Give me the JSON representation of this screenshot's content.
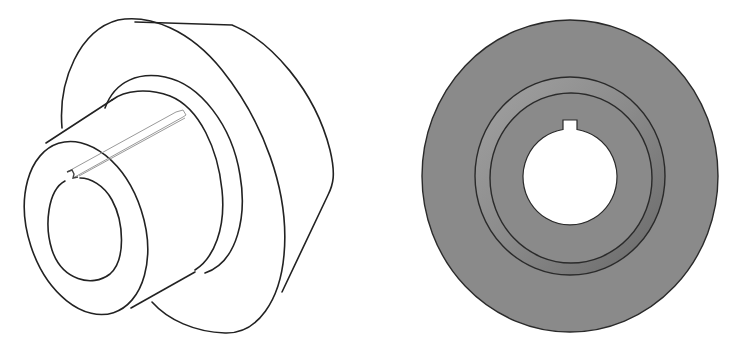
{
  "figure": {
    "type": "mechanical-part-drawing",
    "part": "keyed flanged hub / pulley",
    "views": [
      {
        "id": "isometric",
        "label": "Isometric line view",
        "style": "line-art",
        "stroke_color": "#222222",
        "keyway_stroke_color": "#9a9a9a",
        "fill_color": "#ffffff"
      },
      {
        "id": "front",
        "label": "Front shaded view",
        "style": "shaded",
        "face_color": "#8a8a8a",
        "ring_shadow_color": "#6e6e6e",
        "ring_highlight_color": "#a2a2a2",
        "edge_color": "#2a2a2a",
        "bore_color": "#ffffff"
      }
    ]
  }
}
